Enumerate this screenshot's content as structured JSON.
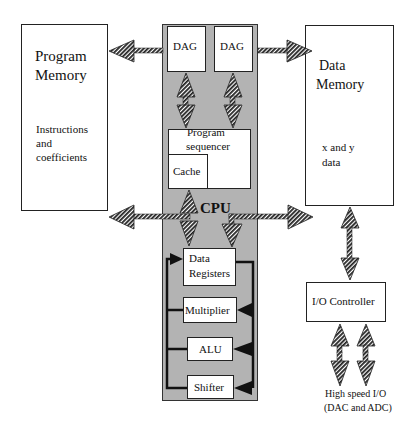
{
  "diagram": {
    "program_memory": {
      "title_line1": "Program",
      "title_line2": "Memory",
      "desc_line1": "Instructions",
      "desc_line2": "and",
      "desc_line3": "coefficients"
    },
    "data_memory": {
      "title_line1": "Data",
      "title_line2": "Memory",
      "desc_line1": "x and y",
      "desc_line2": "data"
    },
    "cpu": {
      "label": "CPU",
      "dag1": "DAG",
      "dag2": "DAG",
      "sequencer_line1": "Program",
      "sequencer_line2": "sequencer",
      "cache": "Cache",
      "data_registers_line1": "Data",
      "data_registers_line2": "Registers",
      "multiplier": "Multiplier",
      "alu": "ALU",
      "shifter": "Shifter"
    },
    "io_controller": {
      "label": "I/O Controller"
    },
    "io_caption": {
      "line1": "High speed I/O",
      "line2": "(DAC and ADC)"
    },
    "colors": {
      "cpu_fill": "#b3b3b3",
      "border": "#222222",
      "arrow": "#222222"
    }
  }
}
